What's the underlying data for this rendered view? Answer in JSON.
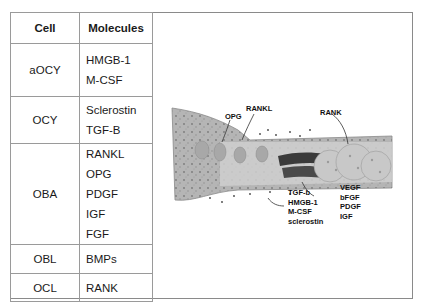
{
  "table": {
    "headers": {
      "cell": "Cell",
      "molecules": "Molecules"
    },
    "rows": [
      {
        "cell": "aOCY",
        "molecules": [
          "HMGB-1",
          "M-CSF"
        ]
      },
      {
        "cell": "OCY",
        "molecules": [
          "Sclerostin",
          "TGF-B"
        ]
      },
      {
        "cell": "OBA",
        "molecules": [
          "RANKL",
          "OPG",
          "PDGF",
          "IGF",
          "FGF"
        ]
      },
      {
        "cell": "OBL",
        "molecules": [
          "BMPs"
        ]
      },
      {
        "cell": "OCL",
        "molecules": [
          "RANK"
        ]
      }
    ]
  },
  "diagram": {
    "labels": {
      "rankl": "RANKL",
      "opg": "OPG",
      "rank": "RANK",
      "left_group": [
        "TGF-b",
        "HMGB-1",
        "M-CSF",
        "sclerostin"
      ],
      "right_group": [
        "VEGF",
        "bFGF",
        "PDGF",
        "IGF"
      ]
    },
    "colors": {
      "tissue": "#b9b9b9",
      "band": "#d6d6d6",
      "dark_cluster": "#3a3a3a",
      "large_cells": "#c8c8c8",
      "border": "#8a8a8a"
    }
  }
}
